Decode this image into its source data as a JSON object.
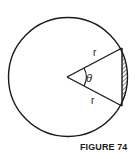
{
  "figure": {
    "caption": "FIGURE 74",
    "labels": {
      "radius_upper": "r",
      "radius_lower": "r",
      "angle": "θ"
    },
    "colors": {
      "stroke": "#1a1a1a",
      "background": "#ffffff"
    }
  }
}
